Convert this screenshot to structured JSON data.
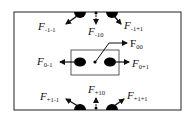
{
  "diagram": {
    "type": "force diagram",
    "outer_box": {
      "x": 14,
      "y": 12,
      "w": 167,
      "h": 98
    },
    "inner_box": {
      "x": 71,
      "y": 50,
      "w": 48,
      "h": 25
    },
    "colors": {
      "stroke": "#111111",
      "fill": "#000000",
      "background": "#ffffff"
    },
    "labels": {
      "F_m1m1": {
        "letter": "F",
        "sub": "-1-1"
      },
      "F_m10": {
        "letter": "F",
        "sub": "-10"
      },
      "F_m1p1": {
        "letter": "F",
        "sub": "-1+1"
      },
      "F_00": {
        "letter": "F",
        "sub": "00"
      },
      "F_0m1": {
        "letter": "F",
        "sub": "0-1"
      },
      "F_0p1": {
        "letter": "F",
        "sub": "0+1"
      },
      "F_p1m1": {
        "letter": "F",
        "sub": "+1-1"
      },
      "F_p10": {
        "letter": "F",
        "sub": "+10"
      },
      "F_p1p1": {
        "letter": "F",
        "sub": "+1+1"
      }
    }
  }
}
